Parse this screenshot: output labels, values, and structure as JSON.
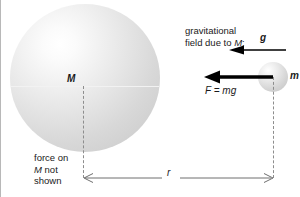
{
  "figure": {
    "width": 300,
    "height": 197,
    "background_color": "#ffffff"
  },
  "bodies": {
    "large_sphere": {
      "label": "M",
      "name": "massive-body",
      "center_x": 84,
      "center_y": 78,
      "radius": 74,
      "shading": "radial highlight upper-left",
      "fill_light": "#ffffff",
      "fill_dark": "#cccccc"
    },
    "small_sphere": {
      "label": "m",
      "name": "test-mass",
      "center_x": 272,
      "center_y": 77,
      "radius": 15,
      "fill_light": "#ffffff",
      "fill_dark": "#c6c6c6"
    }
  },
  "annotations": {
    "field_caption_line1": "gravitational",
    "field_caption_line2": "field due to M:",
    "field_vector_label": "g",
    "force_label": "F = mg",
    "note_line1": "force on",
    "note_line2": "M not",
    "note_line3": "shown",
    "distance_label": "r"
  },
  "vectors": {
    "g_arrow": {
      "label": "g",
      "direction": "left",
      "from_x": 285,
      "to_x": 228,
      "y": 50,
      "thickness": 2,
      "color": "#000000"
    },
    "force_arrow": {
      "label": "F = mg",
      "direction": "left",
      "from_x": 272,
      "to_x": 203,
      "y": 77,
      "thickness": 4,
      "color": "#000000"
    }
  },
  "dimension": {
    "label": "r",
    "from_x": 82,
    "to_x": 272,
    "y": 178,
    "style": "double-headed open arrow",
    "color": "#6e6e6e"
  },
  "colors": {
    "ink": "#1a1a1a",
    "dashed_line": "#8d8d8d",
    "dimension_line": "#6e6e6e",
    "border": "#b8b8b8"
  }
}
